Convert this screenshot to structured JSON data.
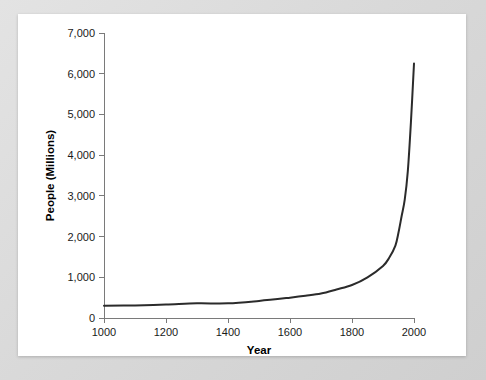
{
  "chart_data": {
    "type": "line",
    "title": "",
    "xlabel": "Year",
    "ylabel": "People (Millions)",
    "xlim": [
      1000,
      2000
    ],
    "ylim": [
      0,
      7000
    ],
    "grid": false,
    "legend": "none",
    "xticks": [
      1000,
      1200,
      1400,
      1600,
      1800,
      2000
    ],
    "xtick_labels": [
      "1000",
      "1200",
      "1400",
      "1600",
      "1800",
      "2000"
    ],
    "yticks": [
      0,
      1000,
      2000,
      3000,
      4000,
      5000,
      6000,
      7000
    ],
    "ytick_labels": [
      "0",
      "1,000",
      "2,000",
      "3,000",
      "4,000",
      "5,000",
      "6,000",
      "7,000"
    ],
    "series": [
      {
        "name": "World population",
        "color": "#2b2b2b",
        "x": [
          1000,
          1100,
          1200,
          1300,
          1400,
          1500,
          1600,
          1650,
          1700,
          1750,
          1800,
          1850,
          1900,
          1920,
          1940,
          1950,
          1960,
          1970,
          1980,
          1990,
          2000
        ],
        "values": [
          300,
          310,
          330,
          360,
          360,
          420,
          500,
          545,
          600,
          700,
          810,
          1000,
          1280,
          1480,
          1780,
          2100,
          2500,
          2900,
          3600,
          4800,
          6250
        ]
      }
    ]
  },
  "figure": {
    "panel_background": "#ffffff",
    "frame_background": "#dcdcdc",
    "axis_color": "#7a7a7a"
  }
}
